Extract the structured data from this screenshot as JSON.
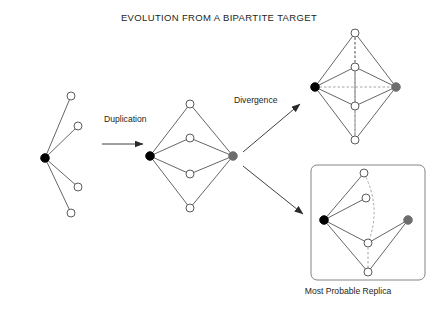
{
  "figure": {
    "title": "EVOLUTION FROM A BIPARTITE TARGET",
    "width": 438,
    "height": 314,
    "background": "#ffffff"
  },
  "labels": {
    "duplication": "Duplication",
    "divergence": "Divergence",
    "most_probable_replica": "Most Probable Replica"
  },
  "colors": {
    "node_black": "#000000",
    "node_gray": "#6d6d6d",
    "node_white": "#ffffff",
    "stroke": "#4a4a4a",
    "text": "#231f20",
    "dashed": "#8a8a8a",
    "box_border": "#777777"
  },
  "panels": [
    {
      "name": "bipartite-target",
      "caption": null,
      "nodes": [
        {
          "id": "hub",
          "type": "black",
          "x": 45,
          "y": 158
        },
        {
          "id": "t1",
          "type": "white",
          "x": 71,
          "y": 96
        },
        {
          "id": "t2",
          "type": "white",
          "x": 78,
          "y": 126
        },
        {
          "id": "t3",
          "type": "white",
          "x": 78,
          "y": 187
        },
        {
          "id": "t4",
          "type": "white",
          "x": 71,
          "y": 213
        }
      ],
      "edges": [
        {
          "from": "hub",
          "to": "t1",
          "style": "solid"
        },
        {
          "from": "hub",
          "to": "t2",
          "style": "solid"
        },
        {
          "from": "hub",
          "to": "t3",
          "style": "solid"
        },
        {
          "from": "hub",
          "to": "t4",
          "style": "solid"
        }
      ]
    },
    {
      "name": "duplicated-bipartite",
      "caption": null,
      "nodes": [
        {
          "id": "dL",
          "type": "black",
          "x": 150,
          "y": 156
        },
        {
          "id": "dR",
          "type": "gray",
          "x": 233,
          "y": 156
        },
        {
          "id": "d1",
          "type": "white",
          "x": 190,
          "y": 104
        },
        {
          "id": "d2",
          "type": "white",
          "x": 190,
          "y": 138
        },
        {
          "id": "d3",
          "type": "white",
          "x": 190,
          "y": 174
        },
        {
          "id": "d4",
          "type": "white",
          "x": 190,
          "y": 208
        }
      ],
      "edges": [
        {
          "from": "dL",
          "to": "d1",
          "style": "solid"
        },
        {
          "from": "dL",
          "to": "d2",
          "style": "solid"
        },
        {
          "from": "dL",
          "to": "d3",
          "style": "solid"
        },
        {
          "from": "dL",
          "to": "d4",
          "style": "solid"
        },
        {
          "from": "dR",
          "to": "d1",
          "style": "solid"
        },
        {
          "from": "dR",
          "to": "d2",
          "style": "solid"
        },
        {
          "from": "dR",
          "to": "d3",
          "style": "solid"
        },
        {
          "from": "dR",
          "to": "d4",
          "style": "solid"
        }
      ]
    },
    {
      "name": "divergent-complete",
      "caption": null,
      "nodes": [
        {
          "id": "cL",
          "type": "black",
          "x": 315,
          "y": 87
        },
        {
          "id": "cR",
          "type": "gray",
          "x": 396,
          "y": 87
        },
        {
          "id": "c1",
          "type": "white",
          "x": 355,
          "y": 33
        },
        {
          "id": "c2",
          "type": "white",
          "x": 355,
          "y": 67
        },
        {
          "id": "c3",
          "type": "white",
          "x": 355,
          "y": 106
        },
        {
          "id": "c4",
          "type": "white",
          "x": 355,
          "y": 140
        }
      ],
      "edges": [
        {
          "from": "cL",
          "to": "c1",
          "style": "solid"
        },
        {
          "from": "cL",
          "to": "c2",
          "style": "solid"
        },
        {
          "from": "cL",
          "to": "c3",
          "style": "solid"
        },
        {
          "from": "cL",
          "to": "c4",
          "style": "solid"
        },
        {
          "from": "cR",
          "to": "c1",
          "style": "solid"
        },
        {
          "from": "cR",
          "to": "c2",
          "style": "solid"
        },
        {
          "from": "cR",
          "to": "c3",
          "style": "solid"
        },
        {
          "from": "cR",
          "to": "c4",
          "style": "solid"
        },
        {
          "from": "cL",
          "to": "cR",
          "style": "dashed"
        },
        {
          "from": "c1",
          "to": "c2",
          "style": "dashed"
        },
        {
          "from": "c1",
          "to": "c3",
          "style": "dashed"
        },
        {
          "from": "c1",
          "to": "c4",
          "style": "dashed"
        },
        {
          "from": "c2",
          "to": "c3",
          "style": "dashed"
        },
        {
          "from": "c2",
          "to": "c4",
          "style": "dashed"
        },
        {
          "from": "c3",
          "to": "c4",
          "style": "dashed"
        }
      ]
    },
    {
      "name": "most-probable-replica",
      "caption": "Most Probable Replica",
      "box": {
        "x": 311,
        "y": 165,
        "width": 114,
        "height": 115
      },
      "nodes": [
        {
          "id": "rL",
          "type": "black",
          "x": 324,
          "y": 220
        },
        {
          "id": "rR",
          "type": "gray",
          "x": 408,
          "y": 220
        },
        {
          "id": "r1",
          "type": "white",
          "x": 364,
          "y": 173
        },
        {
          "id": "r2",
          "type": "white",
          "x": 366,
          "y": 198
        },
        {
          "id": "r3",
          "type": "white",
          "x": 368,
          "y": 243
        },
        {
          "id": "r4",
          "type": "white",
          "x": 368,
          "y": 272
        }
      ],
      "edges": [
        {
          "from": "rL",
          "to": "r1",
          "style": "solid"
        },
        {
          "from": "rL",
          "to": "r2",
          "style": "solid"
        },
        {
          "from": "rL",
          "to": "r3",
          "style": "solid"
        },
        {
          "from": "rL",
          "to": "r4",
          "style": "solid"
        },
        {
          "from": "rR",
          "to": "r3",
          "style": "solid"
        },
        {
          "from": "rR",
          "to": "r4",
          "style": "solid"
        },
        {
          "from": "r1",
          "to": "r3",
          "style": "dashed-curve"
        },
        {
          "from": "r3",
          "to": "r4",
          "style": "dashed"
        }
      ]
    }
  ],
  "arrows": [
    {
      "name": "duplication-arrow",
      "x1": 102,
      "y1": 144,
      "x2": 143,
      "y2": 144
    },
    {
      "name": "divergence-arrow",
      "x1": 243,
      "y1": 152,
      "x2": 300,
      "y2": 104
    },
    {
      "name": "replica-arrow",
      "x1": 243,
      "y1": 166,
      "x2": 303,
      "y2": 214
    }
  ]
}
